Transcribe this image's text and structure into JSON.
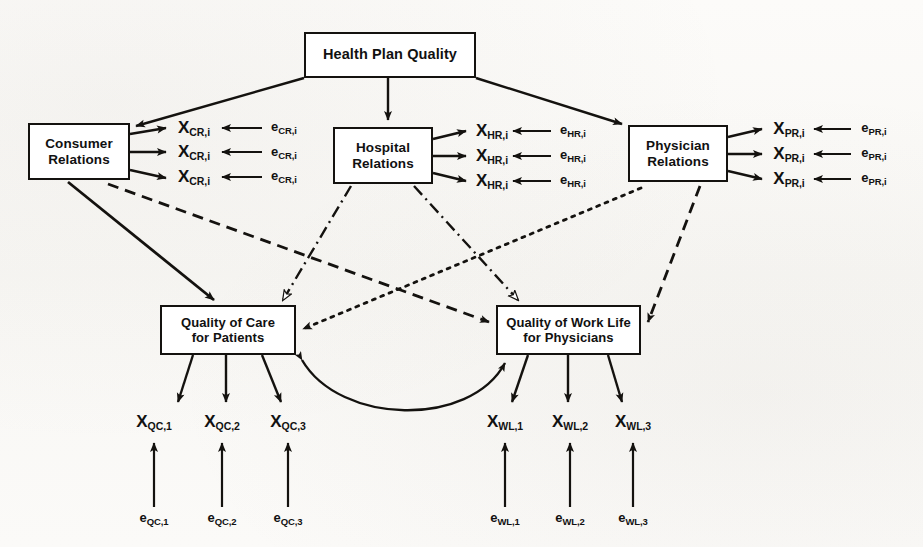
{
  "diagram": {
    "background_color": "#fbfaf8",
    "line_color": "#14120f"
  },
  "nodes": {
    "health_plan_quality": {
      "label": "Health Plan Quality"
    },
    "consumer_relations": {
      "label": "Consumer\nRelations"
    },
    "hospital_relations": {
      "label": "Hospital\nRelations"
    },
    "physician_relations": {
      "label": "Physician\nRelations"
    },
    "quality_of_care": {
      "label": "Quality of Care\nfor Patients"
    },
    "quality_of_work_life": {
      "label": "Quality of Work Life\nfor Physicians"
    }
  },
  "indicators": {
    "consumer_relations": [
      {
        "x_base": "X",
        "x_sub": "CR,i",
        "e_base": "e",
        "e_sub": "CR,i"
      },
      {
        "x_base": "X",
        "x_sub": "CR,i",
        "e_base": "e",
        "e_sub": "CR,i"
      },
      {
        "x_base": "X",
        "x_sub": "CR,i",
        "e_base": "e",
        "e_sub": "CR,i"
      }
    ],
    "hospital_relations": [
      {
        "x_base": "X",
        "x_sub": "HR,i",
        "e_base": "e",
        "e_sub": "HR,i"
      },
      {
        "x_base": "X",
        "x_sub": "HR,i",
        "e_base": "e",
        "e_sub": "HR,i"
      },
      {
        "x_base": "X",
        "x_sub": "HR,i",
        "e_base": "e",
        "e_sub": "HR,i"
      }
    ],
    "physician_relations": [
      {
        "x_base": "X",
        "x_sub": "PR,i",
        "e_base": "e",
        "e_sub": "PR,i"
      },
      {
        "x_base": "X",
        "x_sub": "PR,i",
        "e_base": "e",
        "e_sub": "PR,i"
      },
      {
        "x_base": "X",
        "x_sub": "PR,i",
        "e_base": "e",
        "e_sub": "PR,i"
      }
    ],
    "quality_of_care": [
      {
        "x_base": "X",
        "x_sub": "QC,1",
        "e_base": "e",
        "e_sub": "QC,1"
      },
      {
        "x_base": "X",
        "x_sub": "QC,2",
        "e_base": "e",
        "e_sub": "QC,2"
      },
      {
        "x_base": "X",
        "x_sub": "QC,3",
        "e_base": "e",
        "e_sub": "QC,3"
      }
    ],
    "quality_of_work_life": [
      {
        "x_base": "X",
        "x_sub": "WL,1",
        "e_base": "e",
        "e_sub": "WL,1"
      },
      {
        "x_base": "X",
        "x_sub": "WL,2",
        "e_base": "e",
        "e_sub": "WL,2"
      },
      {
        "x_base": "X",
        "x_sub": "WL,3",
        "e_base": "e",
        "e_sub": "WL,3"
      }
    ]
  },
  "paths": [
    {
      "from": "health_plan_quality",
      "to": "consumer_relations",
      "style": "solid",
      "arrow": "filled"
    },
    {
      "from": "health_plan_quality",
      "to": "hospital_relations",
      "style": "solid",
      "arrow": "filled"
    },
    {
      "from": "health_plan_quality",
      "to": "physician_relations",
      "style": "solid",
      "arrow": "filled"
    },
    {
      "from": "consumer_relations",
      "to": "quality_of_care",
      "style": "solid",
      "arrow": "filled"
    },
    {
      "from": "consumer_relations",
      "to": "quality_of_work_life",
      "style": "dashed",
      "arrow": "filled"
    },
    {
      "from": "hospital_relations",
      "to": "quality_of_care",
      "style": "dash-dot",
      "arrow": "hollow"
    },
    {
      "from": "hospital_relations",
      "to": "quality_of_work_life",
      "style": "dash-dot",
      "arrow": "hollow"
    },
    {
      "from": "physician_relations",
      "to": "quality_of_care",
      "style": "dotted",
      "arrow": "filled"
    },
    {
      "from": "physician_relations",
      "to": "quality_of_work_life",
      "style": "dashed",
      "arrow": "filled"
    },
    {
      "from": "quality_of_care",
      "to": "quality_of_work_life",
      "style": "curved",
      "arrow": "double-headed"
    }
  ]
}
